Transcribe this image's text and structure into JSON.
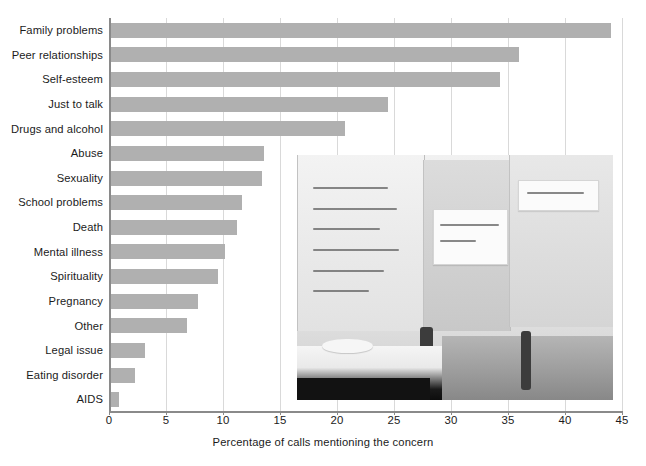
{
  "chart_data": {
    "type": "bar",
    "orientation": "horizontal",
    "title": "",
    "subtitle": "",
    "xlabel": "Percentage of calls mentioning the concern",
    "ylabel": "",
    "xlim": [
      0,
      45
    ],
    "xticks": [
      0,
      5,
      10,
      15,
      20,
      25,
      30,
      35,
      40,
      45
    ],
    "xtick_labels": [
      "0",
      "5",
      "10",
      "15",
      "20",
      "25",
      "30",
      "35",
      "40",
      "45"
    ],
    "grid": "vertical",
    "legend": "none",
    "bar_color": "#b0b0b0",
    "categories": [
      "Family problems",
      "Peer relationships",
      "Self-esteem",
      "Just to talk",
      "Drugs and alcohol",
      "Abuse",
      "Sexuality",
      "School problems",
      "Death",
      "Mental illness",
      "Spirituality",
      "Pregnancy",
      "Other",
      "Legal issue",
      "Eating disorder",
      "AIDS"
    ],
    "values": [
      44,
      36,
      34.3,
      24.5,
      20.7,
      13.6,
      13.4,
      11.7,
      11.2,
      10.2,
      9.6,
      7.8,
      6.8,
      3.2,
      2.3,
      0.9
    ],
    "annotations": []
  },
  "photo": {
    "alt": "Three teenagers seated at a counselling hotline desk with hand-lettered posters on the wall behind them",
    "poster_texts": [
      "Listen when they need a voice",
      "Choose not love"
    ]
  }
}
